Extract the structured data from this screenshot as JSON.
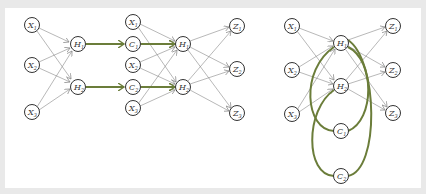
{
  "diagram": {
    "colors": {
      "background": "#e9e9e9",
      "panel": "#ffffff",
      "node_stroke": "#333333",
      "edge": "#888888",
      "highlight": "#6b7d3a"
    },
    "left_net": {
      "inputs": [
        {
          "label": "X",
          "sub": "1"
        },
        {
          "label": "X",
          "sub": "2"
        },
        {
          "label": "X",
          "sub": "3"
        }
      ],
      "hidden": [
        {
          "label": "H",
          "sub": "1"
        },
        {
          "label": "H",
          "sub": "2"
        }
      ]
    },
    "middle_net": {
      "inputs": [
        {
          "label": "X",
          "sub": "1"
        },
        {
          "label": "C",
          "sub": "1"
        },
        {
          "label": "X",
          "sub": "2"
        },
        {
          "label": "C",
          "sub": "2"
        },
        {
          "label": "X",
          "sub": "3"
        }
      ],
      "hidden": [
        {
          "label": "H",
          "sub": "1"
        },
        {
          "label": "H",
          "sub": "2"
        }
      ],
      "outputs": [
        {
          "label": "Z",
          "sub": "1"
        },
        {
          "label": "Z",
          "sub": "2"
        },
        {
          "label": "Z",
          "sub": "3"
        }
      ]
    },
    "right_net": {
      "inputs": [
        {
          "label": "X",
          "sub": "1"
        },
        {
          "label": "X",
          "sub": "2"
        },
        {
          "label": "X",
          "sub": "3"
        }
      ],
      "hidden": [
        {
          "label": "H",
          "sub": "1"
        },
        {
          "label": "H",
          "sub": "2"
        }
      ],
      "context": [
        {
          "label": "C",
          "sub": "1"
        },
        {
          "label": "C",
          "sub": "2"
        }
      ],
      "outputs": [
        {
          "label": "Z",
          "sub": "1"
        },
        {
          "label": "Z",
          "sub": "2"
        },
        {
          "label": "Z",
          "sub": "3"
        }
      ]
    }
  }
}
